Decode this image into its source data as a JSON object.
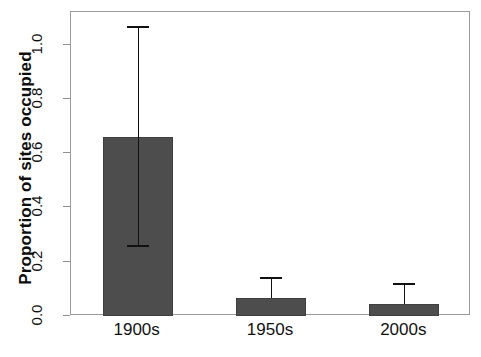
{
  "chart_data": {
    "type": "bar",
    "title": "",
    "xlabel": "",
    "ylabel": "Proportion of sites occupied",
    "categories": [
      "1900s",
      "1950s",
      "2000s"
    ],
    "values": [
      0.66,
      0.066,
      0.044
    ],
    "error_low": [
      0.26,
      0.066,
      0.044
    ],
    "error_high": [
      1.07,
      0.143,
      0.121
    ],
    "ylim": [
      0.0,
      1.12
    ],
    "yticks": [
      0.0,
      0.2,
      0.4,
      0.6,
      0.8,
      1.0
    ],
    "ytick_labels": [
      "0.0",
      "0.2",
      "0.4",
      "0.6",
      "0.8",
      "1.0"
    ],
    "grid": false,
    "legend": null,
    "bar_color": "#4d4d4d",
    "error_color": "#111111",
    "frame_color": "#9a9a9a",
    "background": "#ffffff"
  }
}
